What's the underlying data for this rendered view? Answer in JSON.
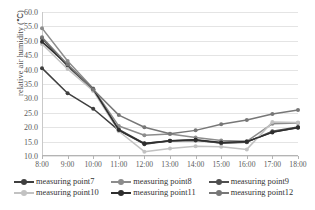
{
  "chart_data": {
    "type": "line",
    "title": "",
    "xlabel": "",
    "ylabel": "relative air humidity (℃)",
    "categories": [
      "8:00",
      "9:00",
      "10:00",
      "11:00",
      "12:00",
      "13:00",
      "14:00",
      "15:00",
      "16:00",
      "17:00",
      "18:00"
    ],
    "ylim": [
      10.0,
      60.0
    ],
    "ytick_step": 5.0,
    "ytick_labels": [
      "60.0",
      "55.0",
      "50.0",
      "45.0",
      "40.0",
      "35.0",
      "30.0",
      "25.0",
      "20.0",
      "15.0",
      "10.0"
    ],
    "grid": true,
    "legend_position": "bottom",
    "series": [
      {
        "name": "measuring point7",
        "color": "#3f3f3f",
        "values": [
          40.5,
          31.8,
          26.4,
          18.9,
          14.1,
          15.3,
          15.4,
          14.6,
          14.9,
          18.3,
          19.8
        ]
      },
      {
        "name": "measuring point8",
        "color": "#8c8c8c",
        "values": [
          54.4,
          43.0,
          33.4,
          20.4,
          17.2,
          17.6,
          16.4,
          15.4,
          15.1,
          21.2,
          21.5
        ]
      },
      {
        "name": "measuring point9",
        "color": "#4f4f4f",
        "values": [
          50.9,
          41.2,
          33.0,
          19.2,
          14.4,
          15.2,
          15.6,
          14.4,
          14.8,
          18.6,
          20.1
        ]
      },
      {
        "name": "measuring point10",
        "color": "#c2c2c2",
        "values": [
          48.9,
          40.2,
          32.6,
          18.6,
          11.5,
          12.6,
          13.4,
          13.2,
          12.3,
          21.8,
          21.6
        ]
      },
      {
        "name": "measuring point11",
        "color": "#2e2e2e",
        "values": [
          49.7,
          41.6,
          33.2,
          19.0,
          14.3,
          15.3,
          15.6,
          14.7,
          15.0,
          18.2,
          19.9
        ]
      },
      {
        "name": "measuring point12",
        "color": "#777777",
        "values": [
          51.2,
          41.8,
          33.1,
          24.2,
          20.0,
          17.7,
          18.9,
          21.0,
          22.5,
          24.6,
          26.0
        ]
      }
    ]
  }
}
